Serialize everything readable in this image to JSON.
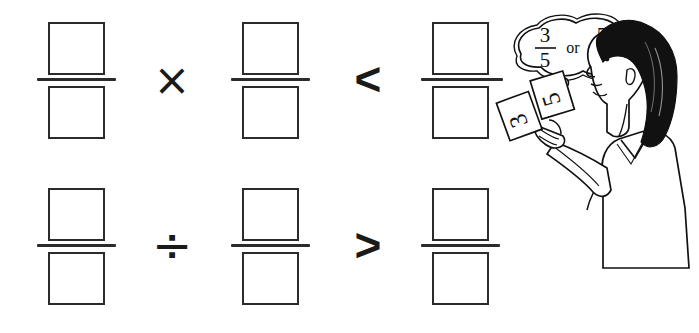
{
  "page": {
    "background_color": "#ffffff",
    "ink_color": "#2b2b2b"
  },
  "rows": [
    {
      "id": "row-multiply",
      "operator": {
        "name": "multiplication-sign",
        "glyph": "×",
        "label": "times"
      },
      "comparator": {
        "name": "less-than-sign",
        "glyph": "<",
        "label": "less than"
      },
      "fractions": [
        {
          "name": "fraction-1",
          "numerator": "",
          "denominator": ""
        },
        {
          "name": "fraction-2",
          "numerator": "",
          "denominator": ""
        },
        {
          "name": "fraction-3",
          "numerator": "",
          "denominator": ""
        }
      ]
    },
    {
      "id": "row-divide",
      "operator": {
        "name": "division-sign",
        "glyph": "÷",
        "label": "divided by"
      },
      "comparator": {
        "name": "greater-than-sign",
        "glyph": ">",
        "label": "greater than"
      },
      "fractions": [
        {
          "name": "fraction-4",
          "numerator": "",
          "denominator": ""
        },
        {
          "name": "fraction-5",
          "numerator": "",
          "denominator": ""
        },
        {
          "name": "fraction-6",
          "numerator": "",
          "denominator": ""
        }
      ]
    }
  ],
  "illustration": {
    "name": "girl-thinking-illustration",
    "description": "Line drawing of a girl in profile holding two number cards",
    "thought_bubble": {
      "name": "thought-bubble",
      "option_a": {
        "numerator": "3",
        "denominator": "5"
      },
      "connector": "or",
      "option_b": {
        "numerator": "5",
        "denominator": "3"
      },
      "question_mark": "?"
    },
    "cards": [
      {
        "name": "number-card-3",
        "value": "3"
      },
      {
        "name": "number-card-5",
        "value": "5"
      }
    ]
  }
}
